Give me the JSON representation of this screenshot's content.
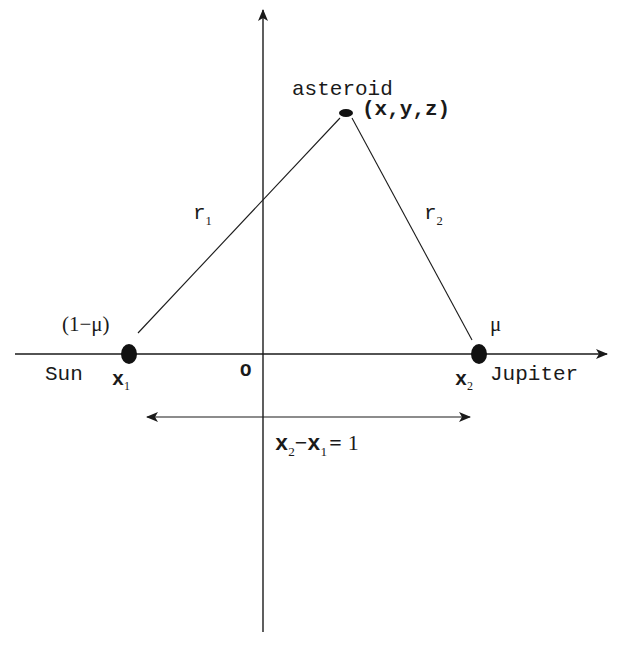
{
  "diagram": {
    "type": "restricted three-body problem geometry",
    "colors": {
      "ink": "#1a1a1a",
      "background": "#ffffff"
    },
    "asteroid": {
      "label": "asteroid",
      "coords_label": "(x,y,z)"
    },
    "sun": {
      "name": "Sun",
      "position_symbol": "x",
      "position_sub": "1",
      "mass_label": "(1−μ)"
    },
    "jupiter": {
      "name": "Jupiter",
      "position_symbol": "x",
      "position_sub": "2",
      "mass_label": "μ"
    },
    "distances": {
      "r1": {
        "symbol": "r",
        "sub": "1"
      },
      "r2": {
        "symbol": "r",
        "sub": "2"
      }
    },
    "origin_label": "O",
    "separation": {
      "left_symbol": "x",
      "left_sub": "2",
      "minus": "−",
      "right_symbol": "x",
      "right_sub": "1",
      "equals": "=",
      "value": "1"
    }
  }
}
